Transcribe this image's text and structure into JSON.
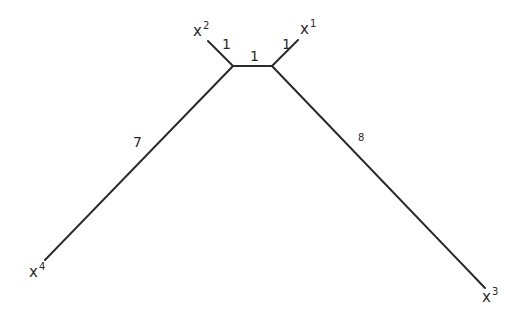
{
  "diagram": {
    "type": "phylogenetic-tree",
    "leaves": [
      {
        "id": "x1",
        "base": "x",
        "sup": "1"
      },
      {
        "id": "x2",
        "base": "x",
        "sup": "2"
      },
      {
        "id": "x3",
        "base": "x",
        "sup": "3"
      },
      {
        "id": "x4",
        "base": "x",
        "sup": "4"
      }
    ],
    "edges": [
      {
        "id": "e-x2",
        "weight": "1"
      },
      {
        "id": "e-internal",
        "weight": "1"
      },
      {
        "id": "e-x1",
        "weight": "1"
      },
      {
        "id": "e-x4",
        "weight": "7"
      },
      {
        "id": "e-x3",
        "weight": "8"
      }
    ],
    "line_color": "#2a2a2a"
  }
}
